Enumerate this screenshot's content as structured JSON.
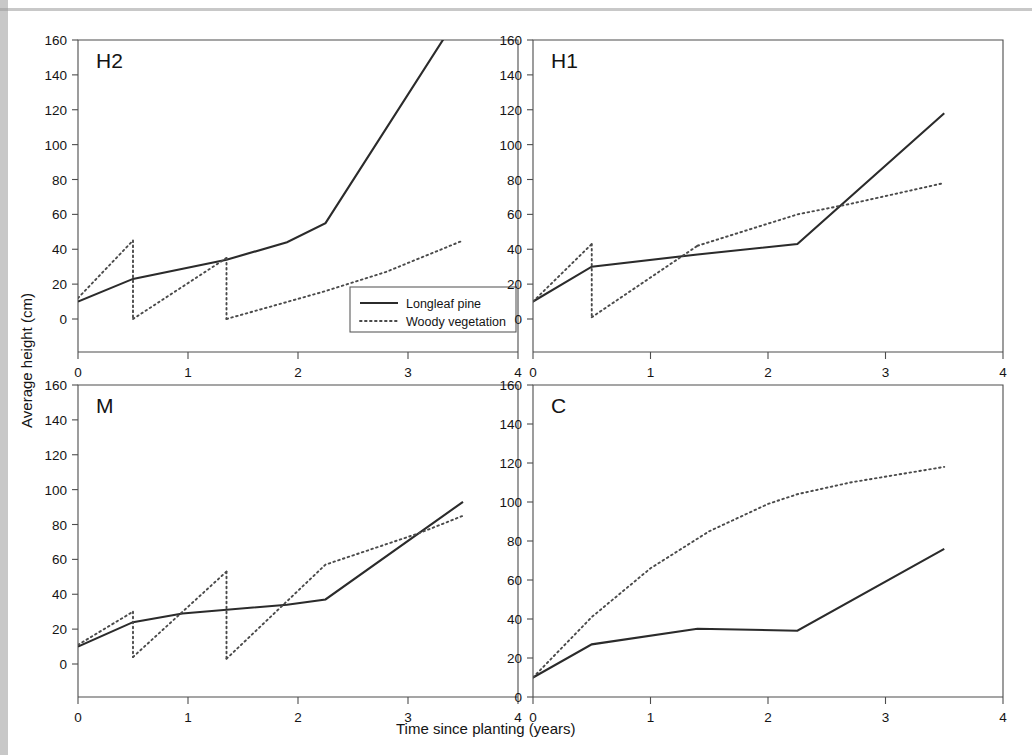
{
  "figure": {
    "xlabel": "Time since planting (years)",
    "ylabel": "Average height (cm)",
    "legend": {
      "items": [
        {
          "label": "Longleaf pine",
          "style": "solid"
        },
        {
          "label": "Woody vegetation",
          "style": "dotted"
        }
      ]
    },
    "panel_tags": {
      "h2": "H2",
      "h1": "H1",
      "m": "M",
      "c": "C"
    },
    "ticks": {
      "y": [
        "0",
        "20",
        "40",
        "60",
        "80",
        "100",
        "120",
        "140",
        "160"
      ],
      "x": [
        "0",
        "1",
        "2",
        "3",
        "4"
      ]
    },
    "colors": {
      "line_solid": "#2b2b2b",
      "line_dotted": "#4a4a4a",
      "axis": "#4d4d4d",
      "background": "#ffffff",
      "text": "#141414"
    }
  },
  "chart_data": [
    {
      "type": "line",
      "title": "H2",
      "xlabel": "Time since planting (years)",
      "ylabel": "Average height (cm)",
      "xlim": [
        0,
        4
      ],
      "ylim": [
        0,
        160
      ],
      "grid": false,
      "legend_position": "inside-lower-right",
      "series": [
        {
          "name": "Longleaf pine",
          "style": "solid",
          "x": [
            0.0,
            0.5,
            1.35,
            1.9,
            2.25,
            3.5
          ],
          "y": [
            10,
            23,
            34,
            44,
            55,
            178
          ]
        },
        {
          "name": "Woody vegetation",
          "style": "dotted",
          "segments": [
            {
              "x": [
                0.0,
                0.5
              ],
              "y": [
                12,
                45
              ]
            },
            {
              "x": [
                0.5,
                0.5
              ],
              "y": [
                45,
                0
              ]
            },
            {
              "x": [
                0.5,
                1.35
              ],
              "y": [
                0,
                35
              ]
            },
            {
              "x": [
                1.35,
                1.35
              ],
              "y": [
                35,
                0
              ]
            },
            {
              "x": [
                1.35,
                2.25,
                2.8,
                3.5
              ],
              "y": [
                0,
                16,
                27,
                45
              ]
            }
          ]
        }
      ]
    },
    {
      "type": "line",
      "title": "H1",
      "xlabel": "Time since planting (years)",
      "ylabel": "Average height (cm)",
      "xlim": [
        0,
        4
      ],
      "ylim": [
        0,
        160
      ],
      "grid": false,
      "legend_position": "none",
      "series": [
        {
          "name": "Longleaf pine",
          "style": "solid",
          "x": [
            0.0,
            0.5,
            1.4,
            2.25,
            3.5
          ],
          "y": [
            10,
            30,
            37,
            43,
            118
          ]
        },
        {
          "name": "Woody vegetation",
          "style": "dotted",
          "segments": [
            {
              "x": [
                0.0,
                0.5
              ],
              "y": [
                10,
                43
              ]
            },
            {
              "x": [
                0.5,
                0.5
              ],
              "y": [
                43,
                1
              ]
            },
            {
              "x": [
                0.5,
                1.4
              ],
              "y": [
                1,
                42
              ]
            },
            {
              "x": [
                1.4,
                2.25,
                2.7,
                3.5
              ],
              "y": [
                42,
                60,
                66,
                78
              ]
            }
          ]
        }
      ]
    },
    {
      "type": "line",
      "title": "M",
      "xlabel": "Time since planting (years)",
      "ylabel": "Average height (cm)",
      "xlim": [
        0,
        4
      ],
      "ylim": [
        0,
        160
      ],
      "grid": false,
      "legend_position": "none",
      "series": [
        {
          "name": "Longleaf pine",
          "style": "solid",
          "x": [
            0.0,
            0.5,
            0.95,
            1.9,
            2.25,
            3.5
          ],
          "y": [
            10,
            24,
            29,
            34,
            37,
            93
          ]
        },
        {
          "name": "Woody vegetation",
          "style": "dotted",
          "segments": [
            {
              "x": [
                0.0,
                0.5
              ],
              "y": [
                11,
                30
              ]
            },
            {
              "x": [
                0.5,
                0.5
              ],
              "y": [
                30,
                4
              ]
            },
            {
              "x": [
                0.5,
                1.35
              ],
              "y": [
                4,
                53
              ]
            },
            {
              "x": [
                1.35,
                1.35
              ],
              "y": [
                53,
                3
              ]
            },
            {
              "x": [
                1.35,
                2.25,
                3.1,
                3.5
              ],
              "y": [
                3,
                57,
                75,
                85
              ]
            }
          ]
        }
      ]
    },
    {
      "type": "line",
      "title": "C",
      "xlabel": "Time since planting (years)",
      "ylabel": "Average height (cm)",
      "xlim": [
        0,
        4
      ],
      "ylim": [
        0,
        160
      ],
      "grid": false,
      "legend_position": "none",
      "series": [
        {
          "name": "Longleaf pine",
          "style": "solid",
          "x": [
            0.0,
            0.5,
            1.4,
            2.25,
            3.5
          ],
          "y": [
            10,
            27,
            35,
            34,
            76
          ]
        },
        {
          "name": "Woody vegetation",
          "style": "dotted",
          "x": [
            0.0,
            0.5,
            1.0,
            1.5,
            2.0,
            2.25,
            2.7,
            3.1,
            3.5
          ],
          "y": [
            10,
            41,
            66,
            85,
            99,
            104,
            110,
            114,
            118
          ]
        }
      ]
    }
  ]
}
